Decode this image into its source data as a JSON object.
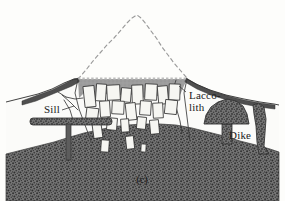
{
  "figure": {
    "caption": "(c)",
    "width": 285,
    "height": 201,
    "background_color": "#fdfdfb"
  },
  "labels": [
    {
      "id": "sill",
      "text": "Sill",
      "x": 44,
      "y": 113
    },
    {
      "id": "laccolith_line1",
      "text": "Lacco-",
      "x": 189,
      "y": 99
    },
    {
      "id": "laccolith_line2",
      "text": "lith",
      "x": 189,
      "y": 111
    },
    {
      "id": "dike",
      "text": "Dike",
      "x": 229,
      "y": 139
    }
  ],
  "colors": {
    "country_rock": "#6e6e6e",
    "country_rock_speckle": "#3a3a3a",
    "neck_fill": "#9a9a9a",
    "intrusion_body": "#fafaf8",
    "block_fill": "#f4f4f0",
    "outline": "#2b2b2b",
    "dashed_cone": "#8a8a8a",
    "dark_band": "#4a4a4a",
    "laccolith_fill": "#6e6e6e",
    "sill_fill": "#6e6e6e",
    "text": "#1a1a1a"
  },
  "geology": {
    "former_volcano_outline": {
      "name": "eroded-volcano-cone",
      "style": "dashed",
      "apex": {
        "x": 137,
        "y": 15
      },
      "points": "78,78 92,62 104,50 114,39 124,28 131,20 137,15 144,21 152,32 161,45 170,57 178,67 186,75"
    },
    "erosion_surface": {
      "name": "present-erosion-surface",
      "y": 78,
      "x_start": 78,
      "x_end": 187,
      "style": "stippled"
    },
    "neck_region": {
      "name": "volcanic-neck-gray-fill",
      "points": "78,78 187,78 186,100 172,94 150,97 128,92 110,96 92,90 79,96"
    },
    "ground_surface": {
      "name": "ground-surface-profile",
      "points": "6,101 22,97 38,93 52,88 64,82 74,78 78,78 187,78 196,83 208,89 224,94 242,98 258,101 272,103 279,104"
    },
    "country_rock_top": {
      "name": "country-rock-boundary",
      "points": "6,152 26,148 44,144 60,140 76,134 90,131 104,128 118,126 132,125 146,124 160,123 176,124 190,126 204,129 218,133 232,137 246,141 260,145 272,149 279,151"
    },
    "sill": {
      "name": "sill-intrusion",
      "slab": {
        "x": 30,
        "y": 118,
        "width": 82,
        "height": 7
      },
      "feeder": {
        "x": 66,
        "y": 124,
        "width": 5,
        "height": 34
      }
    },
    "laccolith": {
      "name": "laccolith-intrusion",
      "dome": "206,123 208,114 213,107 220,102 228,100 236,102 242,107 246,114 248,123",
      "stem": {
        "x": 222,
        "y": 122,
        "width": 10,
        "height": 22
      }
    },
    "dike": {
      "name": "dike-intrusion",
      "points": "258,104 263,106 266,118 265,132 264,145 268,152 260,152 257,140 256,124 254,112"
    },
    "lava_bands": [
      {
        "name": "left-lava-band",
        "points": "24,100 38,95 50,90 62,84 72,79 78,77 78,81 70,85 60,90 48,95 36,100 24,104"
      },
      {
        "name": "right-lava-band",
        "points": "187,78 198,84 212,90 228,95 244,99 260,102 274,104 274,108 258,106 242,103 226,99 210,94 196,88 186,82"
      }
    ],
    "neck_blocks": [
      {
        "x": 84,
        "y": 86,
        "w": 11,
        "h": 21,
        "rot": -6
      },
      {
        "x": 96,
        "y": 84,
        "w": 10,
        "h": 17,
        "rot": 4
      },
      {
        "x": 107,
        "y": 85,
        "w": 13,
        "h": 15,
        "rot": -3
      },
      {
        "x": 121,
        "y": 88,
        "w": 10,
        "h": 14,
        "rot": 5
      },
      {
        "x": 132,
        "y": 85,
        "w": 11,
        "h": 19,
        "rot": -2
      },
      {
        "x": 145,
        "y": 84,
        "w": 12,
        "h": 16,
        "rot": 3
      },
      {
        "x": 158,
        "y": 86,
        "w": 10,
        "h": 18,
        "rot": -5
      },
      {
        "x": 169,
        "y": 84,
        "w": 11,
        "h": 16,
        "rot": 2
      },
      {
        "x": 86,
        "y": 108,
        "w": 12,
        "h": 15,
        "rot": 7
      },
      {
        "x": 100,
        "y": 101,
        "w": 10,
        "h": 16,
        "rot": -4
      },
      {
        "x": 112,
        "y": 101,
        "w": 12,
        "h": 13,
        "rot": 3
      },
      {
        "x": 126,
        "y": 103,
        "w": 10,
        "h": 17,
        "rot": -6
      },
      {
        "x": 140,
        "y": 101,
        "w": 11,
        "h": 14,
        "rot": 4
      },
      {
        "x": 153,
        "y": 103,
        "w": 10,
        "h": 15,
        "rot": -3
      },
      {
        "x": 165,
        "y": 100,
        "w": 12,
        "h": 14,
        "rot": 6
      },
      {
        "x": 93,
        "y": 124,
        "w": 9,
        "h": 14,
        "rot": -8
      },
      {
        "x": 107,
        "y": 118,
        "w": 10,
        "h": 12,
        "rot": 5
      },
      {
        "x": 121,
        "y": 119,
        "w": 8,
        "h": 13,
        "rot": -4
      },
      {
        "x": 137,
        "y": 117,
        "w": 9,
        "h": 12,
        "rot": 6
      },
      {
        "x": 150,
        "y": 120,
        "w": 9,
        "h": 14,
        "rot": -5
      },
      {
        "x": 101,
        "y": 140,
        "w": 8,
        "h": 12,
        "rot": 4
      },
      {
        "x": 126,
        "y": 136,
        "w": 8,
        "h": 13,
        "rot": -6
      },
      {
        "x": 141,
        "y": 144,
        "w": 5,
        "h": 8,
        "rot": 3
      }
    ],
    "fracture_lines": [
      "64,95 74,104 82,112",
      "66,100 72,110 74,118",
      "70,98 78,101 84,100",
      "78,78 76,92 80,108 86,124 92,140",
      "187,78 184,92 186,108 188,124 190,140",
      "176,80 172,92 176,106 180,120"
    ]
  }
}
